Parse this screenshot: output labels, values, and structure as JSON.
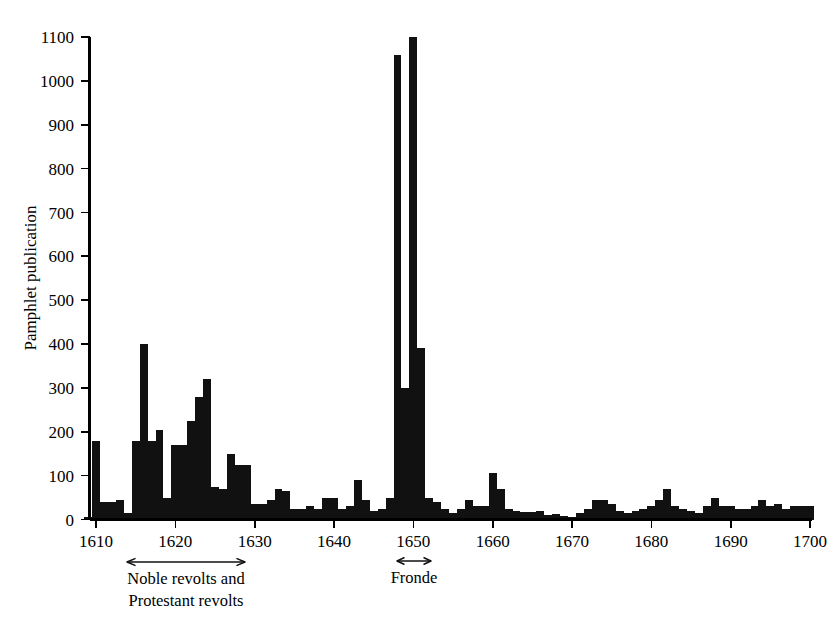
{
  "chart_data": {
    "type": "bar",
    "title": "",
    "subtitle": "",
    "xlabel": "",
    "ylabel": "Pamphlet publication",
    "xlim": [
      1609,
      1701
    ],
    "ylim": [
      0,
      1100
    ],
    "grid": false,
    "legend": null,
    "legend_position": "none",
    "y_ticks": [
      0,
      100,
      200,
      300,
      400,
      500,
      600,
      700,
      800,
      900,
      1000,
      1100
    ],
    "y_tick_labels": [
      "0",
      "100",
      "200",
      "300",
      "400",
      "500",
      "600",
      "700",
      "800",
      "900",
      "1000",
      "1100"
    ],
    "x_ticks": [
      1610,
      1620,
      1630,
      1640,
      1650,
      1660,
      1670,
      1680,
      1690,
      1700
    ],
    "x_tick_labels": [
      "1610",
      "1620",
      "1630",
      "1640",
      "1650",
      "1660",
      "1670",
      "1680",
      "1690",
      "1700"
    ],
    "bar_color": "#111111",
    "x": [
      1609,
      1610,
      1611,
      1612,
      1613,
      1614,
      1615,
      1616,
      1617,
      1618,
      1619,
      1620,
      1621,
      1622,
      1623,
      1624,
      1625,
      1626,
      1627,
      1628,
      1629,
      1630,
      1631,
      1632,
      1633,
      1634,
      1635,
      1636,
      1637,
      1638,
      1639,
      1640,
      1641,
      1642,
      1643,
      1644,
      1645,
      1646,
      1647,
      1648,
      1649,
      1650,
      1651,
      1652,
      1653,
      1654,
      1655,
      1656,
      1657,
      1658,
      1659,
      1660,
      1661,
      1662,
      1663,
      1664,
      1665,
      1666,
      1667,
      1668,
      1669,
      1670,
      1671,
      1672,
      1673,
      1674,
      1675,
      1676,
      1677,
      1678,
      1679,
      1680,
      1681,
      1682,
      1683,
      1684,
      1685,
      1686,
      1687,
      1688,
      1689,
      1690,
      1691,
      1692,
      1693,
      1694,
      1695,
      1696,
      1697,
      1698,
      1699,
      1700
    ],
    "values": [
      5,
      180,
      40,
      40,
      45,
      15,
      180,
      400,
      180,
      205,
      50,
      170,
      170,
      225,
      280,
      320,
      75,
      70,
      150,
      125,
      125,
      35,
      35,
      45,
      70,
      65,
      25,
      25,
      30,
      25,
      50,
      50,
      25,
      30,
      90,
      45,
      20,
      25,
      50,
      1060,
      300,
      1100,
      390,
      50,
      40,
      25,
      15,
      25,
      45,
      30,
      30,
      105,
      70,
      25,
      20,
      18,
      18,
      20,
      10,
      12,
      8,
      5,
      15,
      25,
      45,
      45,
      35,
      20,
      15,
      20,
      25,
      30,
      45,
      70,
      30,
      25,
      20,
      15,
      30,
      50,
      30,
      30,
      25,
      25,
      30,
      45,
      30,
      35,
      25,
      30,
      30,
      30
    ],
    "series": [
      {
        "name": "Pamphlet publication",
        "values": [
          5,
          180,
          40,
          40,
          45,
          15,
          180,
          400,
          180,
          205,
          50,
          170,
          170,
          225,
          280,
          320,
          75,
          70,
          150,
          125,
          125,
          35,
          35,
          45,
          70,
          65,
          25,
          25,
          30,
          25,
          50,
          50,
          25,
          30,
          90,
          45,
          20,
          25,
          50,
          1060,
          300,
          1100,
          390,
          50,
          40,
          25,
          15,
          25,
          45,
          30,
          30,
          105,
          70,
          25,
          20,
          18,
          18,
          20,
          10,
          12,
          8,
          5,
          15,
          25,
          45,
          45,
          35,
          20,
          15,
          20,
          25,
          30,
          45,
          70,
          30,
          25,
          20,
          15,
          30,
          50,
          30,
          30,
          25,
          25,
          30,
          45,
          30,
          35,
          25,
          30,
          30,
          30
        ]
      }
    ],
    "annotations": [
      {
        "id": "noble-protestant-revolts",
        "label_line1": "Noble revolts and",
        "label_line2": "Protestant revolts",
        "x_start": 1614,
        "x_end": 1629,
        "arrow_style": "double-headed"
      },
      {
        "id": "fronde",
        "label_line1": "Fronde",
        "label_line2": "",
        "x_start": 1648,
        "x_end": 1653,
        "arrow_style": "double-headed"
      }
    ]
  },
  "axis": {
    "y_title": "Pamphlet publication"
  },
  "annotations": {
    "noble": {
      "line1": "Noble revolts and",
      "line2": "Protestant revolts"
    },
    "fronde": {
      "line1": "Fronde"
    }
  }
}
